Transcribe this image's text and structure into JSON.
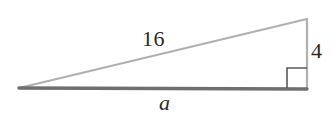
{
  "figure": {
    "kind": "right-triangle-diagram",
    "background_color": "#ffffff",
    "width": 334,
    "height": 118,
    "labels": {
      "hypotenuse": "16",
      "vertical_leg": "4",
      "base_leg": "a"
    },
    "label_color": "#2b2b2b",
    "colors": {
      "hypotenuse_stroke": "#b0b0b0",
      "vertical_stroke": "#b0b0b0",
      "base_stroke": "#6f6f6f",
      "right_angle_stroke": "#5a5a5a"
    },
    "geometry": {
      "left_vertex": [
        19,
        88
      ],
      "top_right_vertex": [
        307,
        19
      ],
      "bottom_right_vertex": [
        307,
        89
      ],
      "right_angle_marker": {
        "x": 287,
        "y": 68,
        "size": 20
      }
    },
    "stroke_widths": {
      "hypotenuse": 2.2,
      "vertical": 2.2,
      "base": 3.4,
      "right_angle": 1.6
    }
  }
}
